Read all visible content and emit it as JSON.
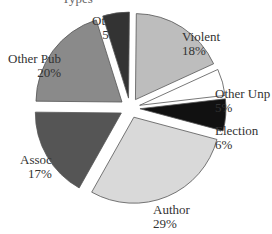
{
  "chart_data": {
    "type": "pie",
    "title": "",
    "exploded": true,
    "slices": [
      {
        "label": "Violent",
        "pct_label": "18%",
        "value": 18,
        "color": "#bdbdbd"
      },
      {
        "label": "Other Unp",
        "pct_label": "5%",
        "value": 5,
        "color": "#ffffff"
      },
      {
        "label": "Election",
        "pct_label": "6%",
        "value": 6,
        "color": "#111111"
      },
      {
        "label": "Author",
        "pct_label": "29%",
        "value": 29,
        "color": "#d9d9d9"
      },
      {
        "label": "Assoc",
        "pct_label": "17%",
        "value": 17,
        "color": "#555555"
      },
      {
        "label": "Other Pub",
        "pct_label": "20%",
        "value": 20,
        "color": "#8a8a8a"
      },
      {
        "label": "Other",
        "pct_label": "5%",
        "value": 5,
        "color": "#333333"
      }
    ]
  },
  "labels": {
    "title_partial": "Types",
    "violent": {
      "name": "Violent",
      "pct": "18%"
    },
    "other_unp": {
      "name": "Other Unp",
      "pct": "5%"
    },
    "election": {
      "name": "Election",
      "pct": "6%"
    },
    "author": {
      "name": "Author",
      "pct": "29%"
    },
    "assoc": {
      "name": "Assoc",
      "pct": "17%"
    },
    "other_pub": {
      "name": "Other Pub",
      "pct": "20%"
    },
    "other": {
      "name": "Other",
      "pct": "5%"
    }
  }
}
